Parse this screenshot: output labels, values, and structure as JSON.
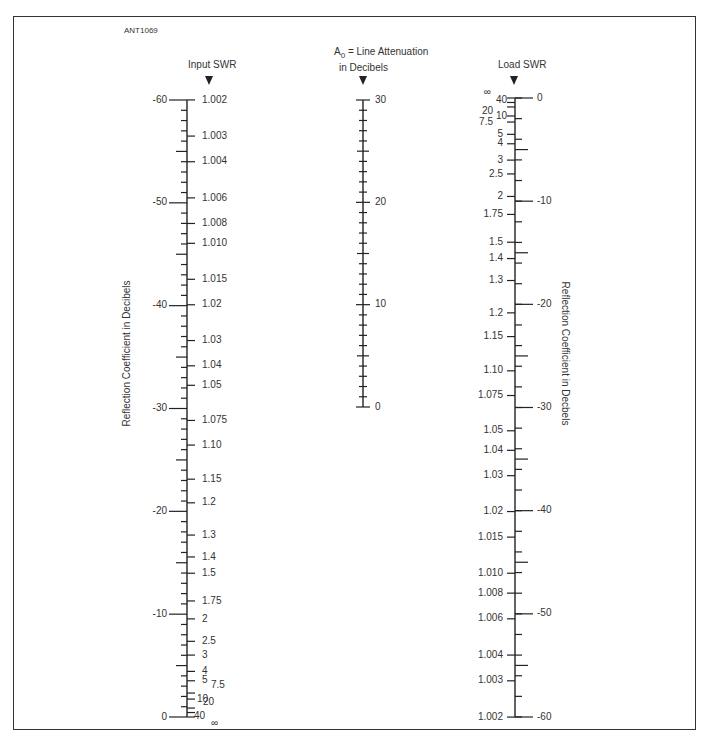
{
  "figure_id": "ANT1069",
  "scales": {
    "input": {
      "title": "Input SWR",
      "axis_label": "Reflection Coefficient in Decibels",
      "db_labels": [
        "-60",
        "-50",
        "-40",
        "-30",
        "-20",
        "-10",
        "0"
      ],
      "db_values": [
        -60,
        -50,
        -40,
        -30,
        -20,
        -10,
        0
      ],
      "swr_labels": [
        "1.002",
        "1.003",
        "1.004",
        "1.006",
        "1.008",
        "1.010",
        "1.015",
        "1.02",
        "1.03",
        "1.04",
        "1.05",
        "1.075",
        "1.10",
        "1.15",
        "1.2",
        "1.3",
        "1.4",
        "1.5",
        "1.75",
        "2",
        "2.5",
        "3",
        "4",
        "5",
        "7.5",
        "10",
        "20",
        "40",
        "∞"
      ]
    },
    "attenuation": {
      "title_line1": "A0 = Line Attenuation",
      "title_prefix": "A",
      "title_sub": "0",
      "title_rest": " = Line Attenuation",
      "title_line2": "in Decibels",
      "labels": [
        "30",
        "20",
        "10",
        "0"
      ],
      "min": 0,
      "max": 30
    },
    "load": {
      "title": "Load SWR",
      "axis_label": "Reflection Coefficient in Decbels",
      "db_labels": [
        "0",
        "-10",
        "-20",
        "-30",
        "-40",
        "-50",
        "-60"
      ],
      "db_values": [
        0,
        -10,
        -20,
        -30,
        -40,
        -50,
        -60
      ],
      "swr_labels": [
        "∞",
        "40",
        "20",
        "10",
        "7.5",
        "5",
        "4",
        "3",
        "2.5",
        "2",
        "1.75",
        "1.5",
        "1.4",
        "1.3",
        "1.2",
        "1.15",
        "1.10",
        "1.075",
        "1.05",
        "1.04",
        "1.03",
        "1.02",
        "1.015",
        "1.010",
        "1.008",
        "1.006",
        "1.004",
        "1.003",
        "1.002"
      ]
    }
  },
  "colors": {
    "ink": "#222222",
    "frame": "#333333",
    "background": "#ffffff"
  }
}
